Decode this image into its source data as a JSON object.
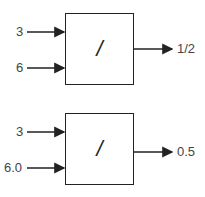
{
  "diagrams": [
    {
      "inputs": [
        "3",
        "6"
      ],
      "operator": "/",
      "output": "1/2"
    },
    {
      "inputs": [
        "3",
        "6.0"
      ],
      "operator": "/",
      "output": "0.5"
    }
  ],
  "colors": {
    "line": "#222222",
    "text": "#444444",
    "background": "#ffffff"
  }
}
